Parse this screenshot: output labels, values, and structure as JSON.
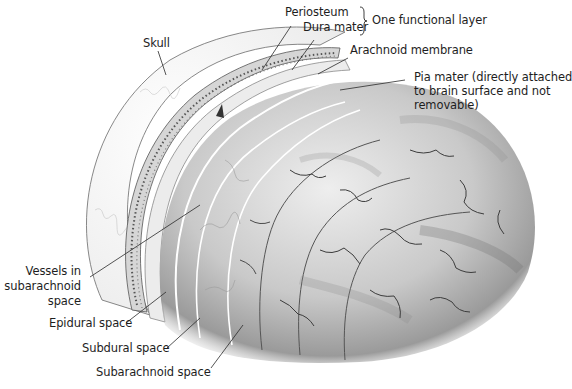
{
  "diagram": {
    "colors": {
      "background": "#ffffff",
      "label_text": "#1e1e1e",
      "leader_line": "#2a2a2a",
      "skull_fill": "#f4f4f4",
      "bone_band": "#cfcfcf",
      "brain_light": "#e6e6e6",
      "brain_mid": "#b8b8b8",
      "brain_dark": "#6e6e6e",
      "sulcus": "#3c3c3c"
    },
    "labels": {
      "skull": "Skull",
      "periosteum": "Periosteum",
      "dura_mater": "Dura mater",
      "one_functional_layer": "One functional layer",
      "arachnoid_membrane": "Arachnoid membrane",
      "pia_mater_line1": "Pia mater (directly attached",
      "pia_mater_line2": "to brain surface and not",
      "pia_mater_line3": "removable)",
      "vessels_line1": "Vessels in",
      "vessels_line2": "subarachnoid",
      "vessels_line3": "space",
      "epidural_space": "Epidural space",
      "subdural_space": "Subdural space",
      "subarachnoid_space": "Subarachnoid space"
    },
    "icons": {
      "brace": "right-curly-brace grouping Periosteum and Dura mater"
    }
  }
}
